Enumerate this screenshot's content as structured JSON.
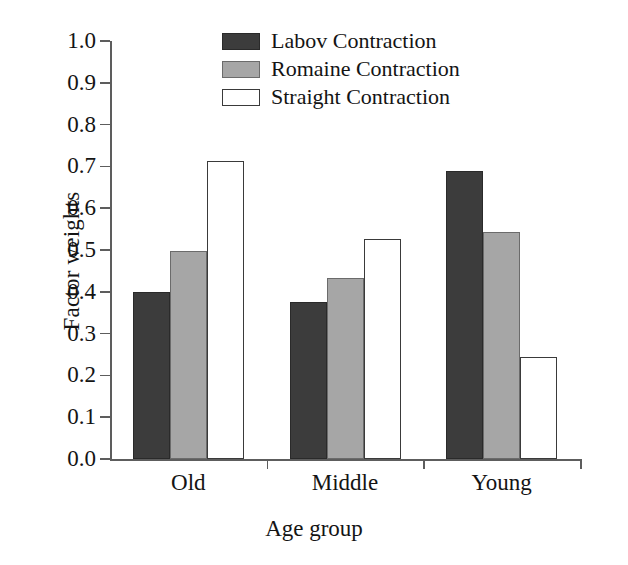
{
  "chart_data": {
    "type": "bar",
    "title": "",
    "xlabel": "Age group",
    "ylabel": "Factor weights",
    "categories": [
      "Old",
      "Middle",
      "Young"
    ],
    "series": [
      {
        "name": "Labov Contraction",
        "color": "#3c3c3c",
        "values": [
          0.4,
          0.375,
          0.69
        ]
      },
      {
        "name": "Romaine Contraction",
        "color": "#a6a6a6",
        "values": [
          0.497,
          0.434,
          0.542
        ]
      },
      {
        "name": "Straight Contraction",
        "color": "#ffffff",
        "values": [
          0.712,
          0.527,
          0.245
        ]
      }
    ],
    "ylim": [
      0.0,
      1.0
    ],
    "ytick_labels": [
      "1.0",
      "0.9",
      "0.8",
      "0.7",
      "0.6",
      "0.5",
      "0.4",
      "0.3",
      "0.2",
      "0.1",
      "0.0"
    ],
    "ytick_values": [
      1.0,
      0.9,
      0.8,
      0.7,
      0.6,
      0.5,
      0.4,
      0.3,
      0.2,
      0.1,
      0.0
    ],
    "grid": false,
    "legend_position": "top-center"
  },
  "legend": {
    "items": [
      {
        "label": "Labov Contraction",
        "swatch": "labov"
      },
      {
        "label": "Romaine Contraction",
        "swatch": "romaine"
      },
      {
        "label": "Straight Contraction",
        "swatch": "straight"
      }
    ]
  }
}
